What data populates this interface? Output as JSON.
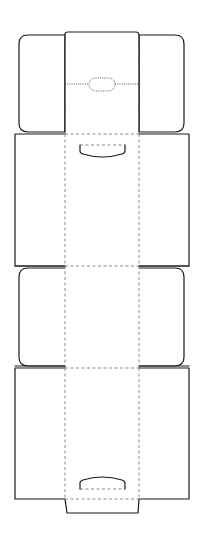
{
  "diagram": {
    "title": "Box dieline template",
    "type": "packaging-dieline",
    "colors": {
      "background": "#ffffff",
      "cut_line": "#1a1a1a",
      "fold_line": "#8a8a8a"
    },
    "legend": {
      "cut": "solid line",
      "fold": "dashed line",
      "perforation": "dotted line"
    },
    "parts": [
      {
        "id": "top-flap",
        "label": "Top tuck flap with hanger slot"
      },
      {
        "id": "front-panel",
        "label": "Panel 1 with thumb notch"
      },
      {
        "id": "middle-flap",
        "label": "Middle flap"
      },
      {
        "id": "back-panel",
        "label": "Panel 2 with thumb notch"
      },
      {
        "id": "bottom-tab",
        "label": "Bottom glue tab"
      }
    ]
  }
}
